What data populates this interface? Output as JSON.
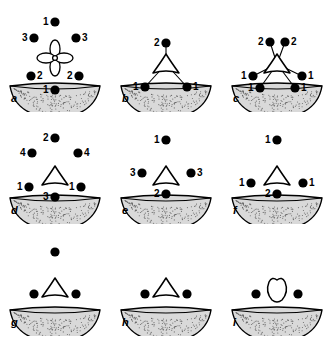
{
  "figure": {
    "type": "schematic-diagram",
    "background_color": "#ffffff",
    "ink_color": "#000000",
    "substrate_fill": "#d9d9d9"
  },
  "panels": [
    {
      "id": "a",
      "label": "a",
      "center_shape": "four-lobed-flower",
      "has_bonds": false,
      "dots": [
        {
          "label": "1",
          "label_side": "left",
          "x": 55,
          "y": 22
        },
        {
          "label": "3",
          "label_side": "left",
          "x": 34,
          "y": 38
        },
        {
          "label": "3",
          "label_side": "right",
          "x": 76,
          "y": 38
        },
        {
          "label": "2",
          "label_side": "right",
          "x": 31,
          "y": 76
        },
        {
          "label": "2",
          "label_side": "left",
          "x": 79,
          "y": 76
        },
        {
          "label": "1",
          "label_side": "left",
          "x": 55,
          "y": 90
        }
      ]
    },
    {
      "id": "b",
      "label": "b",
      "center_shape": "triangle",
      "has_bonds": true,
      "dots": [
        {
          "label": "2",
          "label_side": "left",
          "x": 55,
          "y": 43
        },
        {
          "label": "1",
          "label_side": "left",
          "x": 34,
          "y": 87
        },
        {
          "label": "1",
          "label_side": "right",
          "x": 76,
          "y": 87
        }
      ]
    },
    {
      "id": "c",
      "label": "c",
      "center_shape": "triangle",
      "has_bonds": true,
      "dots": [
        {
          "label": "2",
          "label_side": "left",
          "x": 48,
          "y": 42
        },
        {
          "label": "2",
          "label_side": "right",
          "x": 63,
          "y": 42
        },
        {
          "label": "1",
          "label_side": "left",
          "x": 31,
          "y": 76
        },
        {
          "label": "1",
          "label_side": "right",
          "x": 80,
          "y": 76
        },
        {
          "label": "1",
          "label_side": "left",
          "x": 38,
          "y": 88
        },
        {
          "label": "1",
          "label_side": "right",
          "x": 73,
          "y": 88
        }
      ]
    },
    {
      "id": "d",
      "label": "d",
      "center_shape": "triangle",
      "has_bonds": false,
      "dots": [
        {
          "label": "2",
          "label_side": "left",
          "x": 55,
          "y": 26
        },
        {
          "label": "4",
          "label_side": "left",
          "x": 32,
          "y": 41
        },
        {
          "label": "4",
          "label_side": "right",
          "x": 78,
          "y": 41
        },
        {
          "label": "1",
          "label_side": "left",
          "x": 29,
          "y": 75
        },
        {
          "label": "1",
          "label_side": "left",
          "x": 81,
          "y": 75
        },
        {
          "label": "3",
          "label_side": "left",
          "x": 55,
          "y": 85
        }
      ]
    },
    {
      "id": "e",
      "label": "e",
      "center_shape": "triangle",
      "has_bonds": false,
      "dots": [
        {
          "label": "1",
          "label_side": "left",
          "x": 55,
          "y": 28
        },
        {
          "label": "3",
          "label_side": "left",
          "x": 31,
          "y": 61
        },
        {
          "label": "3",
          "label_side": "right",
          "x": 80,
          "y": 61
        },
        {
          "label": "2",
          "label_side": "left",
          "x": 55,
          "y": 82
        }
      ]
    },
    {
      "id": "f",
      "label": "f",
      "center_shape": "triangle",
      "has_bonds": false,
      "dots": [
        {
          "label": "1",
          "label_side": "left",
          "x": 55,
          "y": 28
        },
        {
          "label": "1",
          "label_side": "left",
          "x": 29,
          "y": 71
        },
        {
          "label": "1",
          "label_side": "right",
          "x": 81,
          "y": 71
        },
        {
          "label": "2",
          "label_side": "left",
          "x": 55,
          "y": 82
        }
      ]
    },
    {
      "id": "g",
      "label": "g",
      "center_shape": "triangle",
      "has_bonds": false,
      "dots": [
        {
          "label": "",
          "label_side": "left",
          "x": 55,
          "y": 28
        },
        {
          "label": "",
          "label_side": "left",
          "x": 34,
          "y": 70
        },
        {
          "label": "",
          "label_side": "left",
          "x": 76,
          "y": 70
        }
      ]
    },
    {
      "id": "h",
      "label": "h",
      "center_shape": "triangle",
      "has_bonds": false,
      "dots": [
        {
          "label": "",
          "label_side": "left",
          "x": 34,
          "y": 70
        },
        {
          "label": "",
          "label_side": "left",
          "x": 76,
          "y": 70
        }
      ]
    },
    {
      "id": "i",
      "label": "i",
      "center_shape": "blob",
      "has_bonds": false,
      "dots": [
        {
          "label": "",
          "label_side": "left",
          "x": 34,
          "y": 70
        },
        {
          "label": "",
          "label_side": "left",
          "x": 76,
          "y": 70
        }
      ]
    }
  ]
}
